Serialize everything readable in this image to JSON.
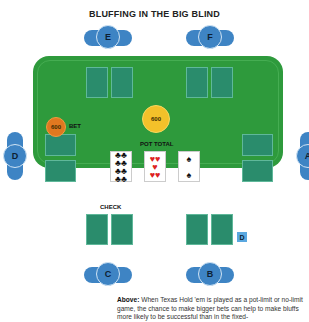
{
  "title": "BLUFFING IN THE BIG BLIND",
  "seats": {
    "A": "A",
    "B": "B",
    "C": "C",
    "D": "D",
    "E": "E",
    "F": "F"
  },
  "bet": {
    "amount": "600",
    "label": "BET"
  },
  "pot": {
    "amount": "600",
    "label": "POT TOTAL"
  },
  "check_label": "CHECK",
  "dealer_button": "D",
  "board": [
    {
      "rank": "8",
      "suit": "♣",
      "color": "#111"
    },
    {
      "rank": "5",
      "suit": "♥",
      "color": "#d22"
    },
    {
      "rank": "3",
      "suit": "♠",
      "color": "#111"
    }
  ],
  "caption": {
    "lead": "Above:",
    "text": " When Texas Hold 'em is played as a pot-limit or no-limit game, the chance to make bigger bets can help to make bluffs more likely to be successful than in the fixed-"
  }
}
